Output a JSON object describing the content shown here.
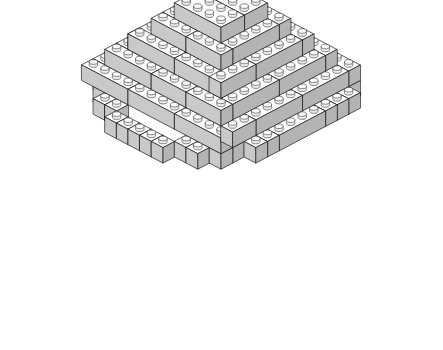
{
  "artwork": {
    "title": "Isometric LEGO Brick Dome",
    "description": "Line-art illustration of a stepped dome built from gray LEGO bricks, drawn in isometric projection",
    "background_color": "#ffffff",
    "outline_color": "#1a1a1a"
  },
  "palette": {
    "top_face": "#fdfdfd",
    "left_face": "#c9c9c9",
    "right_face": "#b4b4b4",
    "stud_top": "#fafafa",
    "stud_side": "#ededed",
    "stroke": "#1a1a1a"
  },
  "projection": {
    "origin_x": 221,
    "origin_y": 96,
    "unit_x_dx": 11.6,
    "unit_x_dy": 6.1,
    "unit_y_dx": -11.6,
    "unit_y_dy": 6.1,
    "unit_z_dy": -15.5,
    "stud_radius_x": 4.2,
    "stud_radius_y": 2.3,
    "stud_height": 3.0
  },
  "structure": {
    "type": "stepped-dome",
    "levels": 6,
    "level_labels": [
      "base",
      "ring-2",
      "ring-3",
      "ring-4",
      "ring-5",
      "apex"
    ],
    "bricks": [
      {
        "level": 0,
        "x": -3,
        "y": -7,
        "w": 1,
        "d": 1
      },
      {
        "level": 0,
        "x": -2,
        "y": -7,
        "w": 1,
        "d": 1
      },
      {
        "level": 0,
        "x": -1,
        "y": -7,
        "w": 4,
        "d": 1
      },
      {
        "level": 0,
        "x": 3,
        "y": -7,
        "w": 1,
        "d": 1
      },
      {
        "level": 0,
        "x": -5,
        "y": -6,
        "w": 1,
        "d": 1
      },
      {
        "level": 0,
        "x": -4,
        "y": -6,
        "w": 1,
        "d": 1
      },
      {
        "level": 0,
        "x": 4,
        "y": -6,
        "w": 1,
        "d": 1
      },
      {
        "level": 0,
        "x": 5,
        "y": -6,
        "w": 1,
        "d": 1
      },
      {
        "level": 0,
        "x": -6,
        "y": -5,
        "w": 1,
        "d": 1
      },
      {
        "level": 0,
        "x": -5,
        "y": -5,
        "w": 1,
        "d": 1
      },
      {
        "level": 0,
        "x": 5,
        "y": -5,
        "w": 1,
        "d": 1
      },
      {
        "level": 0,
        "x": 6,
        "y": -5,
        "w": 1,
        "d": 1
      },
      {
        "level": 0,
        "x": -7,
        "y": -4,
        "w": 1,
        "d": 1
      },
      {
        "level": 0,
        "x": -7,
        "y": -3,
        "w": 1,
        "d": 1
      },
      {
        "level": 0,
        "x": 6,
        "y": -4,
        "w": 1,
        "d": 1
      },
      {
        "level": 0,
        "x": 6,
        "y": -3,
        "w": 1,
        "d": 1
      },
      {
        "level": 0,
        "x": -7,
        "y": -2,
        "w": 1,
        "d": 4
      },
      {
        "level": 0,
        "x": 6,
        "y": -2,
        "w": 1,
        "d": 4
      },
      {
        "level": 0,
        "x": -7,
        "y": 2,
        "w": 1,
        "d": 1
      },
      {
        "level": 0,
        "x": -7,
        "y": 3,
        "w": 1,
        "d": 1
      },
      {
        "level": 0,
        "x": 6,
        "y": 2,
        "w": 1,
        "d": 1
      },
      {
        "level": 0,
        "x": 6,
        "y": 3,
        "w": 1,
        "d": 1
      },
      {
        "level": 0,
        "x": -6,
        "y": 4,
        "w": 1,
        "d": 1
      },
      {
        "level": 0,
        "x": -5,
        "y": 4,
        "w": 1,
        "d": 1
      },
      {
        "level": 0,
        "x": -5,
        "y": 5,
        "w": 1,
        "d": 1
      },
      {
        "level": 0,
        "x": 5,
        "y": 4,
        "w": 1,
        "d": 1
      },
      {
        "level": 0,
        "x": 4,
        "y": 5,
        "w": 1,
        "d": 1
      },
      {
        "level": 0,
        "x": 5,
        "y": 5,
        "w": 1,
        "d": 1
      },
      {
        "level": 0,
        "x": -4,
        "y": 6,
        "w": 1,
        "d": 1
      },
      {
        "level": 0,
        "x": -3,
        "y": 6,
        "w": 1,
        "d": 1
      },
      {
        "level": 0,
        "x": 3,
        "y": 6,
        "w": 1,
        "d": 1
      },
      {
        "level": 0,
        "x": 4,
        "y": 6,
        "w": 1,
        "d": 1
      },
      {
        "level": 0,
        "x": -2,
        "y": 7,
        "w": 1,
        "d": 1
      },
      {
        "level": 0,
        "x": -1,
        "y": 7,
        "w": 1,
        "d": 1
      },
      {
        "level": 0,
        "x": 0,
        "y": 7,
        "w": 1,
        "d": 1
      },
      {
        "level": 0,
        "x": 1,
        "y": 7,
        "w": 1,
        "d": 1
      },
      {
        "level": 0,
        "x": 2,
        "y": 7,
        "w": 1,
        "d": 1
      },
      {
        "level": 1,
        "x": -6,
        "y": -6,
        "w": 4,
        "d": 1
      },
      {
        "level": 1,
        "x": -2,
        "y": -6,
        "w": 4,
        "d": 1
      },
      {
        "level": 1,
        "x": 2,
        "y": -6,
        "w": 4,
        "d": 1
      },
      {
        "level": 1,
        "x": -6,
        "y": -5,
        "w": 1,
        "d": 4
      },
      {
        "level": 1,
        "x": 5,
        "y": -5,
        "w": 1,
        "d": 4
      },
      {
        "level": 1,
        "x": -6,
        "y": -1,
        "w": 1,
        "d": 4
      },
      {
        "level": 1,
        "x": 5,
        "y": -1,
        "w": 1,
        "d": 4
      },
      {
        "level": 1,
        "x": -6,
        "y": 3,
        "w": 1,
        "d": 2
      },
      {
        "level": 1,
        "x": 5,
        "y": 3,
        "w": 1,
        "d": 2
      },
      {
        "level": 1,
        "x": -6,
        "y": 5,
        "w": 4,
        "d": 1
      },
      {
        "level": 1,
        "x": -2,
        "y": 5,
        "w": 4,
        "d": 1
      },
      {
        "level": 1,
        "x": 2,
        "y": 5,
        "w": 4,
        "d": 1
      },
      {
        "level": 2,
        "x": -5,
        "y": -5,
        "w": 4,
        "d": 1
      },
      {
        "level": 2,
        "x": -1,
        "y": -5,
        "w": 3,
        "d": 1
      },
      {
        "level": 2,
        "x": 2,
        "y": -5,
        "w": 3,
        "d": 1
      },
      {
        "level": 2,
        "x": -5,
        "y": -4,
        "w": 1,
        "d": 4
      },
      {
        "level": 2,
        "x": 4,
        "y": -4,
        "w": 1,
        "d": 4
      },
      {
        "level": 2,
        "x": -5,
        "y": 0,
        "w": 1,
        "d": 4
      },
      {
        "level": 2,
        "x": 4,
        "y": 0,
        "w": 1,
        "d": 4
      },
      {
        "level": 2,
        "x": -5,
        "y": 4,
        "w": 4,
        "d": 1
      },
      {
        "level": 2,
        "x": -1,
        "y": 4,
        "w": 3,
        "d": 1
      },
      {
        "level": 2,
        "x": 2,
        "y": 4,
        "w": 3,
        "d": 1
      },
      {
        "level": 3,
        "x": -4,
        "y": -4,
        "w": 4,
        "d": 1
      },
      {
        "level": 3,
        "x": 0,
        "y": -4,
        "w": 4,
        "d": 1
      },
      {
        "level": 3,
        "x": -4,
        "y": -3,
        "w": 1,
        "d": 4
      },
      {
        "level": 3,
        "x": 3,
        "y": -3,
        "w": 1,
        "d": 4
      },
      {
        "level": 3,
        "x": -4,
        "y": 1,
        "w": 1,
        "d": 3
      },
      {
        "level": 3,
        "x": 3,
        "y": 1,
        "w": 1,
        "d": 3
      },
      {
        "level": 3,
        "x": -4,
        "y": 3,
        "w": 4,
        "d": 1
      },
      {
        "level": 3,
        "x": 0,
        "y": 3,
        "w": 4,
        "d": 1
      },
      {
        "level": 4,
        "x": -3,
        "y": -3,
        "w": 3,
        "d": 1
      },
      {
        "level": 4,
        "x": 0,
        "y": -3,
        "w": 3,
        "d": 1
      },
      {
        "level": 4,
        "x": -3,
        "y": -2,
        "w": 1,
        "d": 4
      },
      {
        "level": 4,
        "x": 2,
        "y": -2,
        "w": 1,
        "d": 4
      },
      {
        "level": 4,
        "x": -3,
        "y": 2,
        "w": 3,
        "d": 1
      },
      {
        "level": 4,
        "x": 0,
        "y": 2,
        "w": 3,
        "d": 1
      },
      {
        "level": 5,
        "x": -2,
        "y": -2,
        "w": 4,
        "d": 2
      },
      {
        "level": 5,
        "x": -2,
        "y": 0,
        "w": 4,
        "d": 2
      }
    ]
  }
}
